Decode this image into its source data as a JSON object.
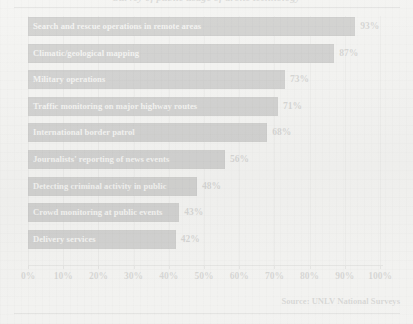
{
  "chart_data": {
    "type": "bar",
    "orientation": "horizontal",
    "title": "Survey of public usage of drone technology",
    "categories": [
      "Search and rescue operations in remote areas",
      "Climatic/geological mapping",
      "Military operations",
      "Traffic monitoring on major highway routes",
      "International border patrol",
      "Journalists' reporting of news events",
      "Detecting criminal activity in public",
      "Crowd monitoring at public events",
      "Delivery services"
    ],
    "values": [
      93,
      87,
      73,
      71,
      68,
      56,
      48,
      43,
      42
    ],
    "value_labels": [
      "93%",
      "87%",
      "73%",
      "71%",
      "68%",
      "56%",
      "48%",
      "43%",
      "42%"
    ],
    "xlabel": "",
    "ylabel": "",
    "xlim": [
      0,
      100
    ],
    "xticks": [
      0,
      10,
      20,
      30,
      40,
      50,
      60,
      70,
      80,
      90,
      100
    ],
    "xtick_labels": [
      "0%",
      "10%",
      "20%",
      "30%",
      "40%",
      "50%",
      "60%",
      "70%",
      "80%",
      "90%",
      "100%"
    ],
    "grid": true,
    "grid_axis": "x",
    "legend": false,
    "bar_color": "#17171a",
    "bar_label_color": "#f4f4f2",
    "background_color": "#f2f2f0"
  },
  "source": "Source:  UNLV National Surveys"
}
